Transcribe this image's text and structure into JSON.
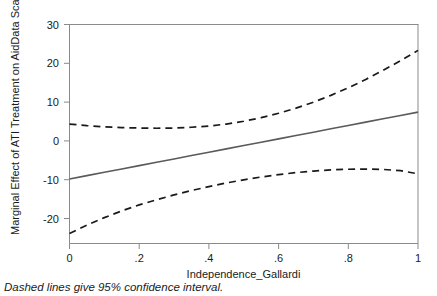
{
  "figure": {
    "caption": "Dashed lines give 95% confidence interval."
  },
  "chart_data": {
    "type": "line",
    "title": "",
    "xlabel": "Independence_Gallardi",
    "ylabel": "Marginal Effect of ATI Treatment on AidData Scale",
    "xlim": [
      0,
      1
    ],
    "ylim": [
      -24,
      31
    ],
    "grid": false,
    "legend": null,
    "xticks": [
      0,
      0.2,
      0.4,
      0.6,
      0.8,
      1
    ],
    "xticklabels": [
      "0",
      ".2",
      ".4",
      ".6",
      ".8",
      "1"
    ],
    "yticks": [
      -20,
      -10,
      0,
      10,
      20,
      30
    ],
    "yticklabels": [
      "-20",
      "-10",
      "0",
      "10",
      "20",
      "30"
    ],
    "x": [
      0,
      0.05,
      0.1,
      0.15,
      0.2,
      0.25,
      0.3,
      0.35,
      0.4,
      0.45,
      0.5,
      0.55,
      0.6,
      0.65,
      0.7,
      0.75,
      0.8,
      0.85,
      0.9,
      0.95,
      1
    ],
    "series": [
      {
        "name": "Marginal effect",
        "style": "solid",
        "color": "#5a5a5a",
        "values": [
          -7.8,
          -6.96,
          -6.12,
          -5.28,
          -4.44,
          -3.6,
          -2.76,
          -1.92,
          -1.08,
          -0.24,
          0.6,
          1.44,
          2.28,
          3.12,
          3.96,
          4.8,
          5.64,
          6.48,
          7.32,
          8.16,
          9.0
        ]
      },
      {
        "name": "Upper 95% confidence bound",
        "style": "dashed",
        "color": "#1a1a1a",
        "values": [
          6.0,
          5.6,
          5.3,
          5.1,
          5.0,
          4.95,
          5.0,
          5.2,
          5.5,
          6.0,
          6.7,
          7.6,
          8.7,
          10.0,
          11.5,
          13.2,
          15.1,
          17.2,
          19.5,
          21.9,
          24.5
        ]
      },
      {
        "name": "Lower 95% confidence bound",
        "style": "dashed",
        "color": "#1a1a1a",
        "values": [
          -21.5,
          -19.4,
          -17.5,
          -15.8,
          -14.3,
          -13.0,
          -11.8,
          -10.7,
          -9.7,
          -8.8,
          -8.0,
          -7.3,
          -6.7,
          -6.2,
          -5.8,
          -5.5,
          -5.35,
          -5.3,
          -5.4,
          -5.7,
          -6.5
        ]
      }
    ]
  }
}
